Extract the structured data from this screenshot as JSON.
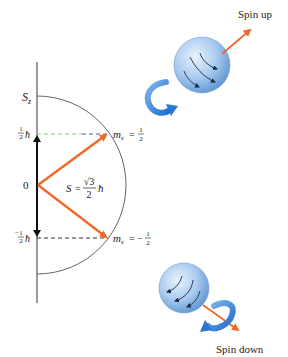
{
  "diagram": {
    "axis_label": "S",
    "axis_label_sub": "z",
    "origin_label": "0",
    "up_level": {
      "num": "1",
      "den": "2",
      "unit": "ħ"
    },
    "down_level": {
      "sign": "−",
      "num": "1",
      "den": "2",
      "unit": "ħ"
    },
    "magnitude_label": {
      "lhs": "S",
      "eq": "=",
      "num": "√3",
      "den": "2",
      "unit": "ħ"
    },
    "ms_up": {
      "m": "m",
      "sub": "s",
      "eq": "=",
      "num": "1",
      "den": "2"
    },
    "ms_down": {
      "m": "m",
      "sub": "s",
      "eq": "= −",
      "num": "1",
      "den": "2"
    },
    "spin_up_label": "Spin up",
    "spin_down_label": "Spin down",
    "colors": {
      "vector": "#ef6a2a",
      "axis": "#222222",
      "arc": "#444444",
      "dash_up_green": "#7ccf6a",
      "dash_up_purple": "#6a3f9a",
      "dash_down": "#333333",
      "sphere": "#9cc4ee",
      "rotation_arrow": "#2f7fd6"
    }
  }
}
